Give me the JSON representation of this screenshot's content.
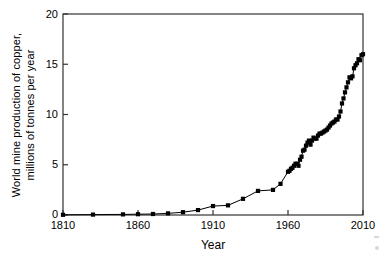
{
  "figure": {
    "background_color": "#ffffff",
    "line_color": "#000000",
    "marker_color": "#000000",
    "axis_color": "#333333"
  },
  "axes": {
    "x_label": "Year",
    "y_label_line1": "World mine production of copper,",
    "y_label_line2": "millions of tonnes per year",
    "x_ticks": [
      "1810",
      "1860",
      "1910",
      "1960",
      "2010"
    ],
    "y_ticks": [
      "0",
      "5",
      "10",
      "15",
      "20"
    ]
  },
  "chart_data": {
    "type": "line",
    "title": "",
    "xlabel": "Year",
    "ylabel": "World mine production of copper, millions of tonnes per year",
    "xlim": [
      1810,
      2010
    ],
    "ylim": [
      0,
      20
    ],
    "x_tick_values": [
      1810,
      1860,
      1910,
      1960,
      2010
    ],
    "y_tick_values": [
      0,
      5,
      10,
      15,
      20
    ],
    "grid": false,
    "legend": "none",
    "marker": "square",
    "series": [
      {
        "name": "World mine production of copper",
        "x": [
          1810,
          1830,
          1850,
          1860,
          1870,
          1880,
          1890,
          1900,
          1910,
          1920,
          1930,
          1940,
          1950,
          1955,
          1960,
          1961,
          1962,
          1963,
          1964,
          1965,
          1966,
          1967,
          1968,
          1969,
          1970,
          1971,
          1972,
          1973,
          1974,
          1975,
          1976,
          1977,
          1978,
          1979,
          1980,
          1981,
          1982,
          1983,
          1984,
          1985,
          1986,
          1987,
          1988,
          1989,
          1990,
          1991,
          1992,
          1993,
          1994,
          1995,
          1996,
          1997,
          1998,
          1999,
          2000,
          2001,
          2002,
          2003,
          2004,
          2005,
          2006,
          2007,
          2008,
          2009,
          2010
        ],
        "y": [
          0.02,
          0.04,
          0.06,
          0.08,
          0.1,
          0.16,
          0.28,
          0.49,
          0.89,
          0.96,
          1.61,
          2.4,
          2.5,
          3.1,
          4.3,
          4.4,
          4.6,
          4.7,
          4.9,
          5.1,
          5.1,
          4.9,
          5.5,
          5.8,
          6.4,
          6.5,
          6.9,
          7.2,
          7.4,
          7.0,
          7.4,
          7.7,
          7.6,
          7.6,
          7.9,
          8.1,
          8.1,
          8.2,
          8.3,
          8.4,
          8.5,
          8.7,
          8.9,
          9.1,
          9.2,
          9.3,
          9.5,
          9.5,
          9.8,
          10.3,
          11.1,
          11.6,
          12.2,
          12.7,
          13.2,
          13.7,
          13.6,
          13.8,
          14.6,
          14.9,
          15.1,
          15.5,
          15.4,
          15.9,
          16.0
        ]
      }
    ]
  }
}
